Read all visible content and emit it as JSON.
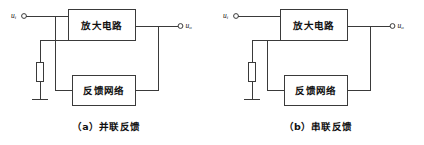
{
  "figure": {
    "type": "circuit-block-diagram",
    "background_color": "#ffffff",
    "line_color": "#3a3a3a",
    "text_color": "#111111",
    "panel_count": 2
  },
  "panels": [
    {
      "id": "a",
      "caption": "（a）并联反馈",
      "caption_marker": "（a）",
      "caption_text": "并联反馈",
      "topology": "parallel-feedback",
      "input_label": "u",
      "input_sub": "i",
      "output_label": "u",
      "output_sub": "o",
      "blocks": [
        {
          "id": "amplifier",
          "label": "放大电路"
        },
        {
          "id": "feedback",
          "label": "反馈网络"
        }
      ],
      "components": [
        {
          "id": "resistor",
          "type": "resistor",
          "label": ""
        },
        {
          "id": "ground",
          "type": "ground",
          "label": ""
        }
      ]
    },
    {
      "id": "b",
      "caption": "（b）串联反馈",
      "caption_marker": "（b）",
      "caption_text": "串联反馈",
      "topology": "series-feedback",
      "input_label": "u",
      "input_sub": "i",
      "output_label": "u",
      "output_sub": "o",
      "blocks": [
        {
          "id": "amplifier",
          "label": "放大电路"
        },
        {
          "id": "feedback",
          "label": "反馈网络"
        }
      ],
      "components": [
        {
          "id": "resistor",
          "type": "resistor",
          "label": ""
        },
        {
          "id": "ground",
          "type": "ground",
          "label": ""
        }
      ]
    }
  ]
}
